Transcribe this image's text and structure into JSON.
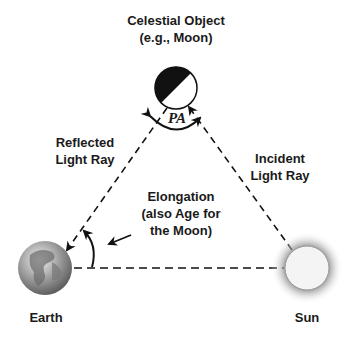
{
  "moon": {
    "line1": "Celestial Object",
    "line2": "(e.g., Moon)"
  },
  "reflected": {
    "line1": "Reflected",
    "line2": "Light Ray"
  },
  "incident": {
    "line1": "Incident",
    "line2": "Light Ray"
  },
  "elongation": {
    "line1": "Elongation",
    "line2": "(also Age for",
    "line3": "the Moon)"
  },
  "pa_label": "PA",
  "earth_label": "Earth",
  "sun_label": "Sun"
}
